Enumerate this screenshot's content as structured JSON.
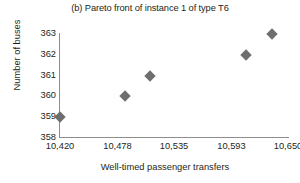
{
  "chart_data": {
    "type": "scatter",
    "title": "(b) Pareto front of instance 1 of type T6",
    "xlabel": "Well-timed passenger transfers",
    "ylabel": "Number of buses",
    "xlim": [
      10420,
      10650
    ],
    "ylim": [
      358,
      363
    ],
    "grid": false,
    "legend": null,
    "marker": "diamond",
    "marker_color": "#6e6e6e",
    "axis_color": "#8d8d8d",
    "xticks": [
      10420,
      10478,
      10535,
      10593,
      10650
    ],
    "xtick_labels": [
      "10,420",
      "10,478",
      "10,535",
      "10,593",
      "10,650"
    ],
    "yticks": [
      358,
      359,
      360,
      361,
      362,
      363
    ],
    "ytick_labels": [
      "358",
      "359",
      "360",
      "361",
      "362",
      "363"
    ],
    "x": [
      10420,
      10486,
      10511,
      10608,
      10634
    ],
    "y": [
      359,
      360,
      361,
      362,
      363
    ],
    "points": [
      {
        "x": 10420,
        "y": 359
      },
      {
        "x": 10486,
        "y": 360
      },
      {
        "x": 10511,
        "y": 361
      },
      {
        "x": 10608,
        "y": 362
      },
      {
        "x": 10634,
        "y": 363
      }
    ]
  }
}
